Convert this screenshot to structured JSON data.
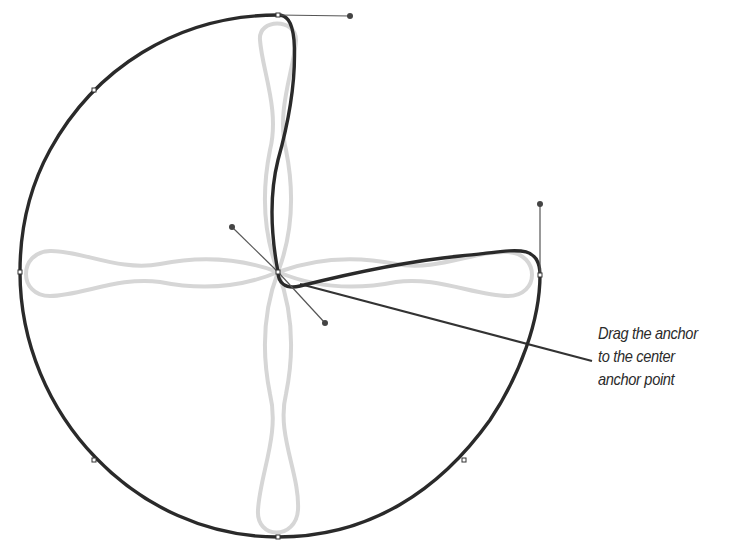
{
  "diagram": {
    "colors": {
      "background": "#ffffff",
      "main_path": "#2a2a2a",
      "ghost_path": "#d4d4d4",
      "handle_line": "#555555",
      "handle_dot": "#444444",
      "anchor_fill": "#ffffff",
      "leader_line": "#333333",
      "callout_text": "#2b2b2b"
    },
    "anchors": [
      {
        "x": 278,
        "y": 15
      },
      {
        "x": 94,
        "y": 90
      },
      {
        "x": 20,
        "y": 272
      },
      {
        "x": 94,
        "y": 460
      },
      {
        "x": 278,
        "y": 537
      },
      {
        "x": 464,
        "y": 460
      },
      {
        "x": 540,
        "y": 275
      },
      {
        "x": 278,
        "y": 272
      }
    ],
    "handles": [
      {
        "from": {
          "x": 278,
          "y": 15
        },
        "to": {
          "x": 350,
          "y": 16
        }
      },
      {
        "from": {
          "x": 540,
          "y": 275
        },
        "to": {
          "x": 540,
          "y": 204
        }
      },
      {
        "from": {
          "x": 278,
          "y": 272
        },
        "to": {
          "x": 232,
          "y": 227
        }
      },
      {
        "from": {
          "x": 278,
          "y": 272
        },
        "to": {
          "x": 325,
          "y": 323
        }
      }
    ],
    "callout": {
      "lines": [
        "Drag the anchor",
        "to the center",
        "anchor point"
      ]
    }
  }
}
